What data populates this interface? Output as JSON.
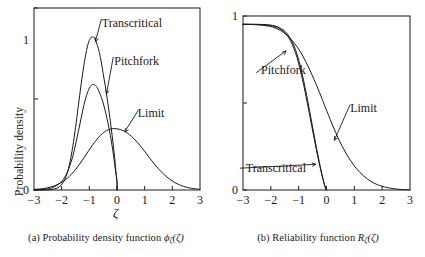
{
  "figure": {
    "background": "#ffffff",
    "ink": "#1a1a1a",
    "panels": [
      {
        "id": "a",
        "caption_prefix": "(a) Probability density function ",
        "caption_symbol": "ϕ",
        "caption_sub": "ζ",
        "caption_arg": "(ζ)",
        "ylabel": "Probability density",
        "xlabel": "ζ"
      },
      {
        "id": "b",
        "caption_prefix": "(b) Reliability function ",
        "caption_symbol": "R",
        "caption_sub": "ζ",
        "caption_arg": "(ζ)",
        "ylabel": "Reliability",
        "xlabel": "ζ"
      }
    ]
  },
  "chart_data": [
    {
      "type": "line",
      "panel": "a",
      "title": "(a) Probability density function ϕζ(ζ)",
      "xlabel": "ζ",
      "ylabel": "Probability density",
      "xlim": [
        -3,
        3
      ],
      "ylim": [
        0,
        1.25
      ],
      "xticks": [
        -3,
        -2,
        -1,
        0,
        1,
        2,
        3
      ],
      "xticklabels": [
        "−3",
        "−2",
        "−1",
        "0",
        "1",
        "2",
        "3"
      ],
      "yticks": [
        0,
        0.625,
        1.25
      ],
      "yticklabels": [
        "0",
        "",
        ""
      ],
      "ylabeled_ticks": [
        {
          "value": 0,
          "label": "0"
        },
        {
          "value": 1,
          "label": "1"
        }
      ],
      "grid": false,
      "legend": "inline-annotations",
      "annotations": [
        {
          "text": "Transcritical",
          "x": -0.55,
          "y": 1.12,
          "arrow_to_x": -0.78,
          "arrow_to_y": 1.02
        },
        {
          "text": "Pitchfork",
          "x": -0.1,
          "y": 0.86,
          "arrow_to_x": -0.38,
          "arrow_to_y": 0.66
        },
        {
          "text": "Limit",
          "x": 0.75,
          "y": 0.5,
          "arrow_to_x": 0.28,
          "arrow_to_y": 0.4
        }
      ],
      "series": [
        {
          "name": "Transcritical",
          "x": [
            -3.0,
            -2.6,
            -2.3,
            -2.1,
            -1.95,
            -1.85,
            -1.75,
            -1.65,
            -1.55,
            -1.45,
            -1.35,
            -1.25,
            -1.15,
            -1.05,
            -0.95,
            -0.88,
            -0.82,
            -0.78,
            -0.72,
            -0.66,
            -0.58,
            -0.5,
            -0.42,
            -0.34,
            -0.26,
            -0.18,
            -0.1,
            -0.04,
            0.0,
            0.0
          ],
          "y": [
            0.0,
            0.0,
            0.005,
            0.02,
            0.05,
            0.09,
            0.15,
            0.24,
            0.36,
            0.5,
            0.65,
            0.79,
            0.91,
            1.0,
            1.045,
            1.05,
            1.045,
            1.03,
            1.0,
            0.96,
            0.89,
            0.8,
            0.71,
            0.61,
            0.5,
            0.38,
            0.25,
            0.13,
            0.05,
            0.0
          ]
        },
        {
          "name": "Pitchfork",
          "x": [
            -3.0,
            -2.6,
            -2.35,
            -2.15,
            -2.0,
            -1.9,
            -1.8,
            -1.7,
            -1.6,
            -1.5,
            -1.4,
            -1.3,
            -1.2,
            -1.1,
            -1.0,
            -0.92,
            -0.85,
            -0.8,
            -0.74,
            -0.68,
            -0.6,
            -0.52,
            -0.44,
            -0.36,
            -0.28,
            -0.2,
            -0.12,
            -0.06,
            0.0,
            0.0
          ],
          "y": [
            0.0,
            0.005,
            0.015,
            0.035,
            0.06,
            0.085,
            0.12,
            0.17,
            0.23,
            0.31,
            0.4,
            0.49,
            0.58,
            0.65,
            0.7,
            0.72,
            0.725,
            0.72,
            0.71,
            0.69,
            0.655,
            0.61,
            0.555,
            0.49,
            0.415,
            0.33,
            0.23,
            0.14,
            0.06,
            0.0
          ]
        },
        {
          "name": "Limit",
          "x": [
            -3.0,
            -2.7,
            -2.4,
            -2.1,
            -1.8,
            -1.5,
            -1.2,
            -0.9,
            -0.6,
            -0.3,
            0.0,
            0.3,
            0.6,
            0.9,
            1.2,
            1.5,
            1.8,
            2.1,
            2.4,
            2.7,
            3.0
          ],
          "y": [
            0.004,
            0.009,
            0.02,
            0.042,
            0.08,
            0.14,
            0.22,
            0.305,
            0.375,
            0.415,
            0.42,
            0.4,
            0.355,
            0.29,
            0.215,
            0.145,
            0.09,
            0.05,
            0.025,
            0.011,
            0.005
          ]
        }
      ]
    },
    {
      "type": "line",
      "panel": "b",
      "title": "(b) Reliability function Rζ(ζ)",
      "xlabel": "ζ",
      "ylabel": "Reliability",
      "xlim": [
        -3,
        3
      ],
      "ylim": [
        0,
        1.05
      ],
      "xticks": [
        -3,
        -2,
        -1,
        0,
        1,
        2,
        3
      ],
      "xticklabels": [
        "−3",
        "−2",
        "−1",
        "0",
        "1",
        "2",
        "3"
      ],
      "ylabeled_ticks": [
        {
          "value": 0,
          "label": "0"
        },
        {
          "value": 1,
          "label": "1"
        }
      ],
      "grid": false,
      "legend": "inline-annotations",
      "annotations": [
        {
          "text": "Pitchfork",
          "x": -2.35,
          "y": 0.7,
          "arrow_to_x": -1.45,
          "arrow_to_y": 0.84
        },
        {
          "text": "Limit",
          "x": 0.85,
          "y": 0.47,
          "arrow_to_x": 0.28,
          "arrow_to_y": 0.3
        },
        {
          "text": "Transcritical",
          "x": -2.9,
          "y": 0.11,
          "arrow_to_x": -0.38,
          "arrow_to_y": 0.155
        }
      ],
      "series": [
        {
          "name": "Transcritical",
          "x": [
            -3.0,
            -2.6,
            -2.3,
            -2.05,
            -1.85,
            -1.7,
            -1.55,
            -1.42,
            -1.3,
            -1.18,
            -1.06,
            -0.96,
            -0.86,
            -0.76,
            -0.66,
            -0.56,
            -0.46,
            -0.36,
            -0.26,
            -0.17,
            -0.09,
            -0.03,
            0.0
          ],
          "y": [
            1.0,
            1.0,
            0.999,
            0.996,
            0.99,
            0.98,
            0.965,
            0.945,
            0.915,
            0.875,
            0.82,
            0.76,
            0.69,
            0.61,
            0.525,
            0.435,
            0.345,
            0.255,
            0.17,
            0.1,
            0.045,
            0.01,
            0.0
          ]
        },
        {
          "name": "Pitchfork",
          "x": [
            -3.0,
            -2.6,
            -2.3,
            -2.05,
            -1.85,
            -1.7,
            -1.55,
            -1.42,
            -1.3,
            -1.18,
            -1.06,
            -0.96,
            -0.86,
            -0.76,
            -0.66,
            -0.56,
            -0.46,
            -0.36,
            -0.26,
            -0.17,
            -0.09,
            -0.03,
            0.0
          ],
          "y": [
            1.0,
            0.999,
            0.997,
            0.993,
            0.986,
            0.975,
            0.958,
            0.935,
            0.902,
            0.858,
            0.8,
            0.737,
            0.665,
            0.585,
            0.5,
            0.412,
            0.325,
            0.24,
            0.16,
            0.093,
            0.04,
            0.008,
            0.0
          ]
        },
        {
          "name": "Limit",
          "x": [
            -3.0,
            -2.6,
            -2.3,
            -2.05,
            -1.85,
            -1.65,
            -1.45,
            -1.25,
            -1.05,
            -0.85,
            -0.65,
            -0.45,
            -0.25,
            -0.05,
            0.2,
            0.45,
            0.7,
            0.95,
            1.2,
            1.45,
            1.7,
            1.95,
            2.2,
            2.45,
            2.7,
            3.0
          ],
          "y": [
            1.0,
            0.998,
            0.994,
            0.988,
            0.978,
            0.962,
            0.938,
            0.905,
            0.862,
            0.808,
            0.742,
            0.668,
            0.588,
            0.503,
            0.398,
            0.302,
            0.222,
            0.157,
            0.106,
            0.069,
            0.042,
            0.025,
            0.014,
            0.007,
            0.003,
            0.001
          ]
        }
      ]
    }
  ]
}
